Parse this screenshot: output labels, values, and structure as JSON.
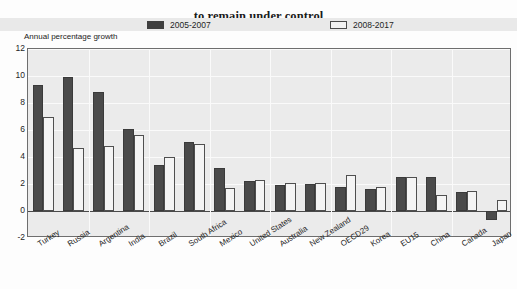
{
  "title": {
    "line1": "Growth in health spending is expected",
    "line2": "to remain under control"
  },
  "axis_caption": "Annual percentage growth",
  "legend": [
    {
      "label": "2005-2007",
      "swatch": "dark",
      "color": "#4a4a4a"
    },
    {
      "label": "2008-2017",
      "swatch": "light",
      "color": "#f4f4f4"
    }
  ],
  "chart_data": {
    "type": "bar",
    "title": "Growth in health spending is expected to remain under control",
    "xlabel": "",
    "ylabel": "Annual percentage growth",
    "ylim": [
      -2,
      12
    ],
    "yticks": [
      -2,
      0,
      2,
      4,
      6,
      8,
      10,
      12
    ],
    "grid": true,
    "legend_position": "top",
    "categories": [
      "Turkey",
      "Russia",
      "Argentina",
      "India",
      "Brazil",
      "South Africa",
      "Mexico",
      "United States",
      "Australia",
      "New Zealand",
      "OECD29",
      "Korea",
      "EU15",
      "China",
      "Canada",
      "Japan"
    ],
    "series": [
      {
        "name": "2005-2007",
        "color": "#4a4a4a",
        "values": [
          9.3,
          9.9,
          8.8,
          6.1,
          3.4,
          5.1,
          3.2,
          2.2,
          1.9,
          2.0,
          1.8,
          1.6,
          2.5,
          2.5,
          1.4,
          -0.7
        ]
      },
      {
        "name": "2008-2017",
        "color": "#f4f4f4",
        "values": [
          7.0,
          4.7,
          4.8,
          5.6,
          4.0,
          5.0,
          1.7,
          2.3,
          2.1,
          2.1,
          2.7,
          1.8,
          2.5,
          1.2,
          1.5,
          0.8
        ]
      }
    ]
  }
}
